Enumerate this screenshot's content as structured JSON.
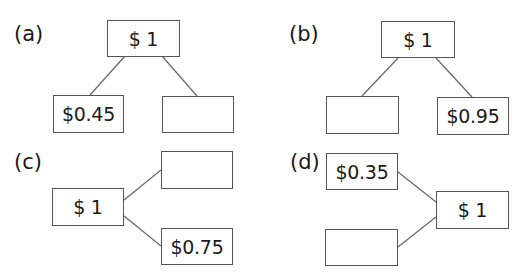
{
  "diagrams": [
    {
      "label": "(a)",
      "whole": "$ 1",
      "part_left": "$0.45",
      "part_right": ""
    },
    {
      "label": "(b)",
      "whole": "$ 1",
      "part_left": "",
      "part_right": "$0.95"
    },
    {
      "label": "(c)",
      "whole": "$ 1",
      "part_top": "",
      "part_bottom": "$0.75"
    },
    {
      "label": "(d)",
      "whole": "$ 1",
      "part_top": "$0.35",
      "part_bottom": ""
    }
  ],
  "colors": {
    "line": "#666666",
    "border": "#555555",
    "text": "#1a1a1a"
  }
}
